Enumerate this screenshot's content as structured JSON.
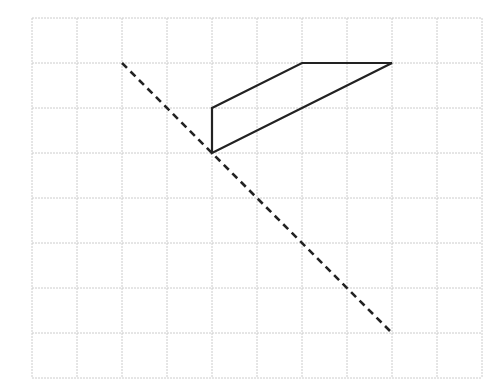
{
  "diagram": {
    "grid": {
      "origin_px": [
        32,
        18
      ],
      "cell_px": 45,
      "columns": 10,
      "rows": 8,
      "line_color": "#cccccc",
      "background": "#ffffff"
    },
    "shape": {
      "type": "quadrilateral",
      "stroke": "#222222",
      "stroke_width": 2.2,
      "vertices_grid": [
        [
          4,
          2
        ],
        [
          6,
          1
        ],
        [
          8,
          1
        ],
        [
          4,
          3
        ]
      ]
    },
    "mirror_line": {
      "type": "dashed",
      "stroke": "#222222",
      "stroke_width": 2.6,
      "dash": "7,5",
      "from_grid": [
        2,
        1
      ],
      "to_grid": [
        8,
        7
      ]
    }
  }
}
